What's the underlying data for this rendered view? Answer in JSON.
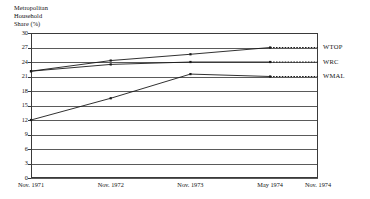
{
  "chart_data": {
    "type": "line",
    "title": "Metropolitan Household Share (%)",
    "title_lines": [
      "Metropolitan",
      "Household",
      "Share (%)"
    ],
    "xlabel": "",
    "ylabel": "Metropolitan Household Share (%)",
    "categories": [
      "Nov. 1971",
      "Nov. 1972",
      "Nov. 1973",
      "May 1974",
      "Nov. 1974"
    ],
    "x_positions": [
      0,
      1,
      2,
      3,
      3.6
    ],
    "ylim": [
      0,
      30
    ],
    "yticks": [
      30,
      27,
      24,
      21,
      18,
      15,
      12,
      9,
      6,
      3,
      0
    ],
    "ytick_labels": [
      "30",
      "27",
      "24",
      "21",
      "18",
      "15",
      "12",
      "9",
      "6",
      "3",
      "0"
    ],
    "grid": true,
    "legend": "right-inline-labels",
    "series": [
      {
        "name": "WTOP",
        "label": "WTOP",
        "values": [
          22.1,
          24.3,
          25.6,
          27.0,
          27.0
        ],
        "solid_through": 3,
        "dashed_after": true,
        "color": "#1a1a1a"
      },
      {
        "name": "WRC",
        "label": "WRC",
        "values": [
          22.1,
          23.5,
          24.0,
          24.0,
          24.0
        ],
        "solid_through": 3,
        "dashed_after": true,
        "color": "#1a1a1a"
      },
      {
        "name": "WMAL",
        "label": "WMAL",
        "values": [
          12.0,
          16.5,
          21.5,
          21.0,
          21.0
        ],
        "solid_through": 3,
        "dashed_after": true,
        "color": "#1a1a1a"
      }
    ]
  }
}
